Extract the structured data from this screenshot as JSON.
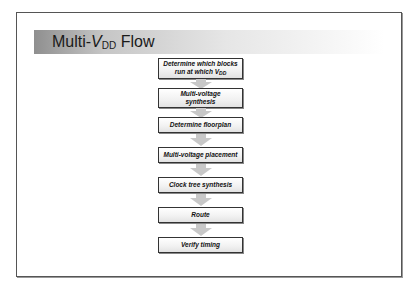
{
  "slide": {
    "title_prefix": "Multi-",
    "title_var": "V",
    "title_sub": "DD",
    "title_suffix": " Flow"
  },
  "flow": {
    "steps": [
      {
        "line1": "Determine which blocks",
        "line2_prefix": "run at which V",
        "line2_sub": "DD"
      },
      {
        "line1": "Multi-voltage",
        "line2": "synthesis"
      },
      {
        "label": "Determine floorplan"
      },
      {
        "label": "Multi-voltage placement"
      },
      {
        "label": "Clock tree synthesis"
      },
      {
        "label": "Route"
      },
      {
        "label": "Verify timing"
      }
    ],
    "colors": {
      "box_border": "#333333",
      "arrow": "#c8c8c8",
      "header_dark": "#8f8f8f"
    }
  }
}
